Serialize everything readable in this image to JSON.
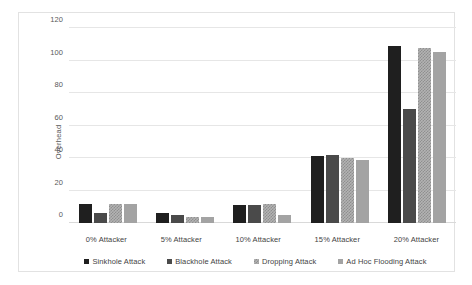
{
  "chart_data": {
    "type": "bar",
    "title": "",
    "xlabel": "",
    "ylabel": "Overhead",
    "ylim": [
      0,
      120
    ],
    "yticks": [
      0,
      20,
      40,
      60,
      80,
      100,
      120
    ],
    "grid": true,
    "legend_position": "bottom",
    "categories": [
      "0% Attacker",
      "5% Attacker",
      "10% Attacker",
      "15% Attacker",
      "20% Attacker"
    ],
    "series": [
      {
        "name": "Sinkhole Attack",
        "color": "#1f1f1f",
        "values": [
          12,
          6,
          11,
          41,
          109
        ]
      },
      {
        "name": "Blackhole Attack",
        "color": "#4a4a4a",
        "values": [
          6,
          5,
          11,
          42,
          70
        ]
      },
      {
        "name": "Dropping Attack",
        "color": "#b3b3b3",
        "values": [
          12,
          4,
          12,
          40,
          108
        ]
      },
      {
        "name": "Ad Hoc Flooding Attack",
        "color": "#a3a3a3",
        "values": [
          12,
          4,
          5,
          39,
          105
        ]
      }
    ]
  }
}
